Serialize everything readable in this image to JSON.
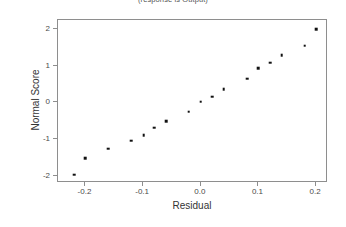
{
  "chart_data": {
    "type": "scatter",
    "title": "(response is Output)",
    "xlabel": "Residual",
    "ylabel": "Normal Score",
    "xlim": [
      -0.2476,
      0.2206
    ],
    "ylim": [
      -2.2,
      2.25
    ],
    "grid": false,
    "legend": null,
    "xticks": [
      -0.2,
      -0.1,
      0.0,
      0.1,
      0.2
    ],
    "xticklabels": [
      "-0.2",
      "-0.1",
      "0.0",
      "0.1",
      "0.2"
    ],
    "yticks": [
      -2,
      -1,
      0,
      1,
      2
    ],
    "yticklabels": [
      "-2",
      "-1",
      "0",
      "1",
      "2"
    ],
    "marker": "square",
    "marker_color": "#111111",
    "frame_color": "#8e8e8e",
    "points": [
      {
        "x": -0.219,
        "y": -1.97
      },
      {
        "x": -0.2,
        "y": -1.52
      },
      {
        "x": -0.161,
        "y": -1.26
      },
      {
        "x": -0.121,
        "y": -1.05
      },
      {
        "x": -0.099,
        "y": -0.9
      },
      {
        "x": -0.081,
        "y": -0.69
      },
      {
        "x": -0.06,
        "y": -0.51
      },
      {
        "x": -0.021,
        "y": -0.25
      },
      {
        "x": 0.0,
        "y": 0.02
      },
      {
        "x": 0.02,
        "y": 0.16
      },
      {
        "x": 0.04,
        "y": 0.36
      },
      {
        "x": 0.08,
        "y": 0.65
      },
      {
        "x": 0.1,
        "y": 0.93
      },
      {
        "x": 0.12,
        "y": 1.08
      },
      {
        "x": 0.14,
        "y": 1.29
      },
      {
        "x": 0.18,
        "y": 1.55
      },
      {
        "x": 0.2,
        "y": 2.0
      }
    ]
  }
}
